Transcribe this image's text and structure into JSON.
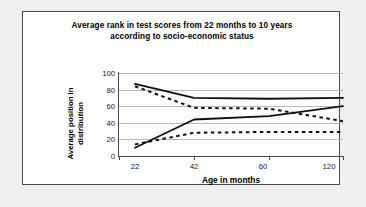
{
  "chart_data": {
    "type": "line",
    "title": "Average rank in test scores from 22 months to 10 years according to socio-economic status",
    "title_line1": "Average rank in test scores from 22 months to 10 years",
    "title_line2": "according to socio-economic status",
    "xlabel": "Age in months",
    "ylabel": "Average position in distribution",
    "ylabel_line1": "Average position in",
    "ylabel_line2": "distribution",
    "categories": [
      "22",
      "42",
      "60",
      "120"
    ],
    "x": [
      22,
      42,
      60,
      120
    ],
    "ylim": [
      0,
      100
    ],
    "yticks": [
      "0",
      "20",
      "40",
      "60",
      "80",
      "100"
    ],
    "ytick_values": [
      0,
      20,
      40,
      60,
      80,
      100
    ],
    "grid": "horizontal",
    "legend": "none",
    "series": [
      {
        "name": "High SES, high early score",
        "style": "solid",
        "color": "#101010",
        "values": [
          87,
          70,
          69,
          70
        ]
      },
      {
        "name": "Low SES, high early score",
        "style": "dashed",
        "color": "#101010",
        "values": [
          84,
          58,
          57,
          42
        ]
      },
      {
        "name": "High SES, low early score",
        "style": "solid",
        "color": "#101010",
        "values": [
          10,
          44,
          48,
          60
        ]
      },
      {
        "name": "Low SES, low early score",
        "style": "dashed",
        "color": "#101010",
        "values": [
          14,
          28,
          29,
          29
        ]
      }
    ]
  },
  "figure": {
    "background": "#efefef",
    "panel_background": "#fdfdfd",
    "border_color": "#4a4a4a",
    "grid_color": "#b9b9b9"
  }
}
